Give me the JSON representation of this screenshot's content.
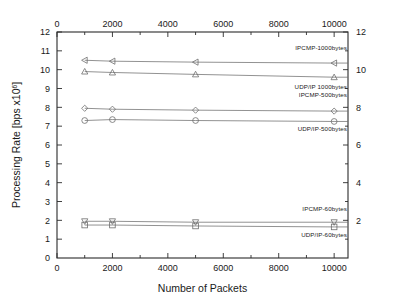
{
  "chart_data": {
    "type": "line",
    "title": "",
    "xlabel": "Number of Packets",
    "ylabel": "Processing Rate [bps x10",
    "ylabel_exponent": "6",
    "ylabel_tail": "]",
    "xlim": [
      0,
      10500
    ],
    "ylim": [
      0,
      12
    ],
    "grid": false,
    "legend_position": "inline-right",
    "x": [
      1000,
      2000,
      5000,
      10000
    ],
    "x_ticks": [
      0,
      2000,
      4000,
      6000,
      8000,
      10000
    ],
    "x_tick_labels": [
      "0",
      "2000",
      "4000",
      "6000",
      "8000",
      "10000"
    ],
    "x_minor_ticks": [
      1000,
      3000,
      5000,
      7000,
      9000
    ],
    "top_axis_ticks": [
      0,
      2000,
      4000,
      6000,
      8000,
      10000
    ],
    "top_axis_tick_labels": [
      "0",
      "2000",
      "4000",
      "6000",
      "8000",
      "10000"
    ],
    "y_ticks_left": [
      1,
      2,
      3,
      4,
      5,
      6,
      7,
      8,
      9,
      10,
      11,
      12
    ],
    "y_tick_labels_left": [
      "1",
      "2",
      "3",
      "4",
      "5",
      "6",
      "7",
      "8",
      "9",
      "10",
      "11",
      "12"
    ],
    "y_tick_label_zero_left": "0",
    "y_ticks_right": [
      2,
      4,
      6,
      8,
      10,
      12
    ],
    "y_tick_labels_right": [
      "2",
      "4",
      "6",
      "8",
      "10",
      "12"
    ],
    "series": [
      {
        "name": "IPCMP-1000bytes",
        "marker": "triangle-left",
        "values": [
          10.5,
          10.45,
          10.4,
          10.35
        ],
        "label_x": 10500,
        "label_y": 11.05,
        "label_anchor": "end"
      },
      {
        "name": "UDP/IP 1000bytes",
        "marker": "triangle-up",
        "values": [
          9.9,
          9.85,
          9.75,
          9.6
        ],
        "label_x": 10500,
        "label_y": 9.0,
        "label_anchor": "end"
      },
      {
        "name": "IPCMP-500bytes",
        "marker": "diamond",
        "values": [
          7.95,
          7.9,
          7.85,
          7.8
        ],
        "label_x": 10500,
        "label_y": 8.55,
        "label_anchor": "end"
      },
      {
        "name": "UDP/IP-500bytes",
        "marker": "circle",
        "values": [
          7.3,
          7.35,
          7.3,
          7.25
        ],
        "label_x": 10500,
        "label_y": 6.75,
        "label_anchor": "end"
      },
      {
        "name": "IPCMP-60bytes",
        "marker": "triangle-down",
        "values": [
          1.95,
          1.95,
          1.9,
          1.9
        ],
        "label_x": 10500,
        "label_y": 2.5,
        "label_anchor": "end"
      },
      {
        "name": "UDP/IP-60bytes",
        "marker": "square",
        "values": [
          1.75,
          1.75,
          1.7,
          1.65
        ],
        "label_x": 10500,
        "label_y": 1.1,
        "label_anchor": "end"
      }
    ],
    "colors": {
      "axis": "#2b2b2b",
      "series_line": "#6d6d6d",
      "background": "#ffffff",
      "text": "#1a1a1a"
    }
  }
}
